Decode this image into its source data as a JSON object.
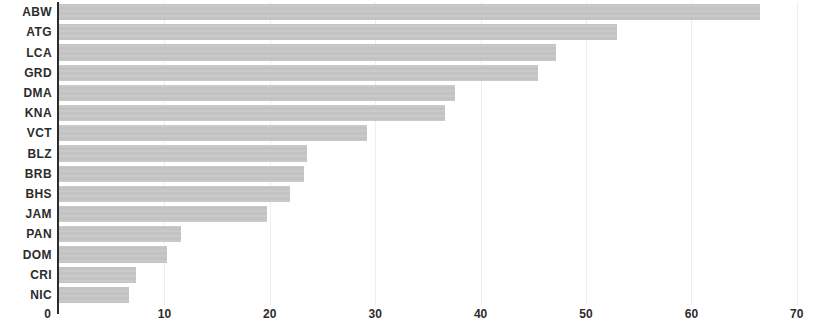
{
  "chart_data": {
    "type": "bar",
    "orientation": "horizontal",
    "title": "",
    "subtitle": "",
    "xlabel": "",
    "ylabel": "",
    "xlim": [
      0,
      70
    ],
    "ylim": null,
    "xticks": [
      "0",
      "10",
      "20",
      "30",
      "40",
      "50",
      "60",
      "70"
    ],
    "xtick_values": [
      0,
      10,
      20,
      30,
      40,
      50,
      60,
      70
    ],
    "grid": true,
    "grid_axis": "x",
    "legend": null,
    "bar_color": "#c3c3c3",
    "axis_color": "#2b2b2b",
    "categories": [
      "ABW",
      "ATG",
      "LCA",
      "GRD",
      "DMA",
      "KNA",
      "VCT",
      "BLZ",
      "BRB",
      "BHS",
      "JAM",
      "PAN",
      "DOM",
      "CRI",
      "NIC"
    ],
    "values": [
      66.5,
      52.9,
      47.2,
      45.4,
      37.6,
      36.6,
      29.2,
      23.5,
      23.2,
      21.9,
      19.7,
      11.6,
      10.2,
      7.3,
      6.6
    ]
  }
}
